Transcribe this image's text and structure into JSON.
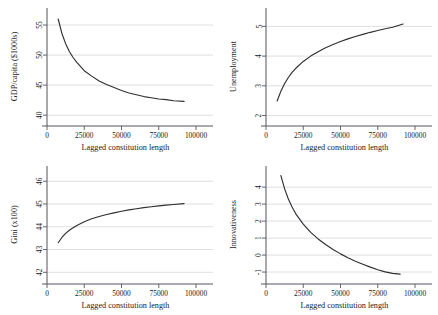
{
  "figure": {
    "background_color": "#ffffff",
    "curve_color": "#2f2f33",
    "grid_color": "#c9c9cf",
    "axis_color": "#55555c",
    "layout": "2x2 grid of line plots"
  },
  "shared": {
    "xlabel": "Lagged constitution length",
    "xticks": [
      "0",
      "25000",
      "50000",
      "75000",
      "100000"
    ],
    "xlim": [
      0,
      100000
    ]
  },
  "chart_data": [
    {
      "type": "line",
      "panel": "top-left",
      "title": "",
      "xlabel": "Lagged constitution length",
      "ylabel": "GDP/capita ($1000s)",
      "xlim": [
        0,
        100000
      ],
      "ylim": [
        39.2,
        57.0
      ],
      "xticks": [
        0,
        25000,
        50000,
        75000,
        100000
      ],
      "xtick_labels": [
        "0",
        "25000",
        "50000",
        "75000",
        "100000"
      ],
      "yticks": [
        40,
        45,
        50,
        55
      ],
      "ytick_labels": [
        "40",
        "45",
        "50",
        "55"
      ],
      "grid": "horizontal",
      "legend": "none",
      "series": [
        {
          "name": "GDP/capita fitted",
          "x": [
            7500,
            10000,
            12500,
            15000,
            17500,
            20000,
            25000,
            30000,
            35000,
            40000,
            45000,
            50000,
            55000,
            60000,
            65000,
            70000,
            75000,
            80000,
            85000,
            92000
          ],
          "values": [
            56.0,
            53.6,
            51.9,
            50.6,
            49.6,
            48.8,
            47.4,
            46.5,
            45.7,
            45.1,
            44.6,
            44.1,
            43.7,
            43.4,
            43.1,
            42.9,
            42.7,
            42.6,
            42.4,
            42.3
          ]
        }
      ]
    },
    {
      "type": "line",
      "panel": "top-right",
      "title": "",
      "xlabel": "Lagged constitution length",
      "ylabel": "Unemployment",
      "xlim": [
        0,
        100000
      ],
      "ylim": [
        1.85,
        5.45
      ],
      "xticks": [
        0,
        25000,
        50000,
        75000,
        100000
      ],
      "xtick_labels": [
        "0",
        "25000",
        "50000",
        "75000",
        "100000"
      ],
      "yticks": [
        2,
        3,
        4,
        5
      ],
      "ytick_labels": [
        "2",
        "3",
        "4",
        "5"
      ],
      "grid": "horizontal",
      "legend": "none",
      "series": [
        {
          "name": "Unemployment fitted",
          "x": [
            7500,
            10000,
            12500,
            15000,
            17500,
            20000,
            25000,
            30000,
            35000,
            40000,
            45000,
            50000,
            55000,
            60000,
            65000,
            70000,
            75000,
            80000,
            85000,
            92000
          ],
          "values": [
            2.49,
            2.82,
            3.08,
            3.28,
            3.45,
            3.59,
            3.82,
            4.0,
            4.15,
            4.28,
            4.39,
            4.49,
            4.58,
            4.66,
            4.73,
            4.8,
            4.86,
            4.92,
            4.97,
            5.08
          ]
        }
      ]
    },
    {
      "type": "line",
      "panel": "bottom-left",
      "title": "",
      "xlabel": "Lagged constitution length",
      "ylabel": "Gini (x100)",
      "xlim": [
        0,
        100000
      ],
      "ylim": [
        41.75,
        46.45
      ],
      "xticks": [
        0,
        25000,
        50000,
        75000,
        100000
      ],
      "xtick_labels": [
        "0",
        "25000",
        "50000",
        "75000",
        "100000"
      ],
      "yticks": [
        42,
        43,
        44,
        45,
        46
      ],
      "ytick_labels": [
        "42",
        "43",
        "44",
        "45",
        "46"
      ],
      "grid": "horizontal",
      "legend": "none",
      "series": [
        {
          "name": "Gini fitted",
          "x": [
            7500,
            10000,
            12500,
            15000,
            17500,
            20000,
            25000,
            30000,
            35000,
            40000,
            45000,
            50000,
            55000,
            60000,
            65000,
            70000,
            75000,
            80000,
            85000,
            92000
          ],
          "values": [
            43.3,
            43.53,
            43.71,
            43.85,
            43.96,
            44.06,
            44.22,
            44.35,
            44.45,
            44.54,
            44.61,
            44.68,
            44.74,
            44.79,
            44.84,
            44.88,
            44.92,
            44.95,
            44.98,
            45.02
          ]
        }
      ]
    },
    {
      "type": "line",
      "panel": "bottom-right",
      "title": "",
      "xlabel": "Lagged constitution length",
      "ylabel": "Innovativeness",
      "xlim": [
        0,
        100000
      ],
      "ylim": [
        -1.35,
        4.95
      ],
      "xticks": [
        0,
        25000,
        50000,
        75000,
        100000
      ],
      "xtick_labels": [
        "0",
        "25000",
        "50000",
        "75000",
        "100000"
      ],
      "yticks": [
        -1,
        0,
        1,
        2,
        3,
        4
      ],
      "ytick_labels": [
        "-1",
        "0",
        "1",
        "2",
        "3",
        "4"
      ],
      "grid": "horizontal",
      "legend": "none",
      "series": [
        {
          "name": "Innovativeness fitted",
          "x": [
            10000,
            12500,
            15000,
            17500,
            20000,
            25000,
            30000,
            35000,
            40000,
            45000,
            50000,
            55000,
            60000,
            65000,
            70000,
            75000,
            80000,
            85000,
            90000
          ],
          "values": [
            4.68,
            3.9,
            3.3,
            2.83,
            2.43,
            1.82,
            1.34,
            0.95,
            0.62,
            0.33,
            0.07,
            -0.16,
            -0.36,
            -0.54,
            -0.71,
            -0.86,
            -0.99,
            -1.08,
            -1.12
          ]
        }
      ]
    }
  ]
}
